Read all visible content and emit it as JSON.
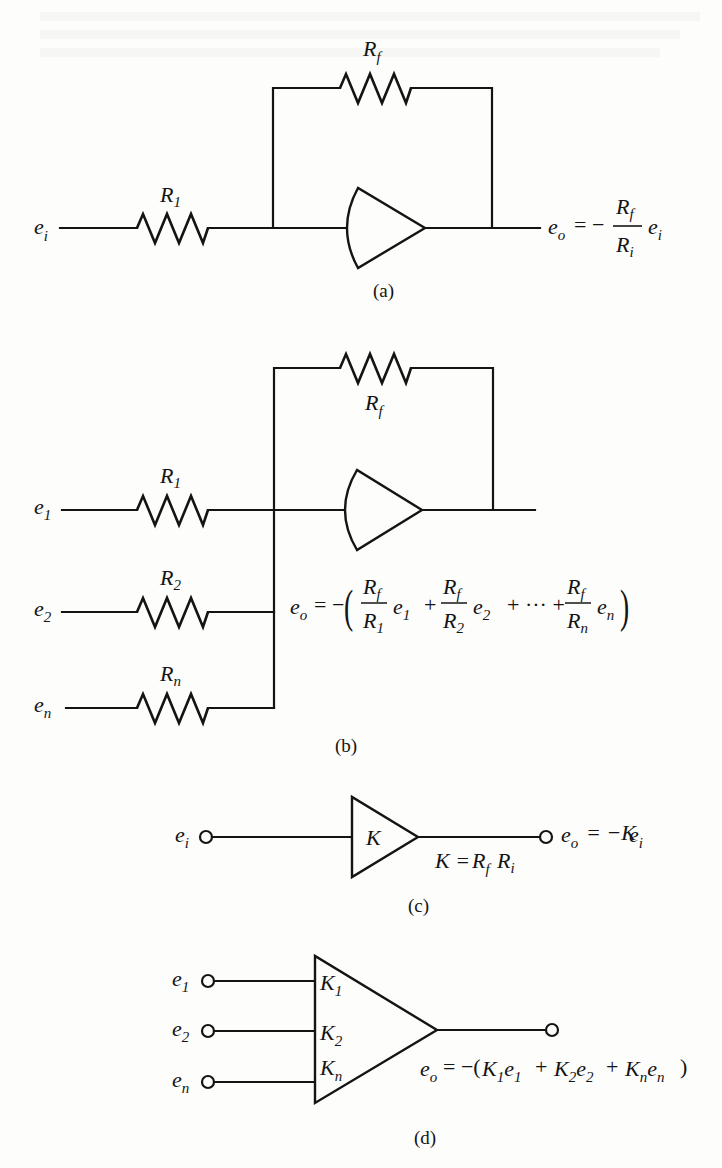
{
  "figure": {
    "panels": [
      {
        "id": "a",
        "caption": "(a)",
        "title": "Inverting amplifier",
        "input_label": {
          "base": "e",
          "sub": "i"
        },
        "input_resistor": {
          "base": "R",
          "sub": "1"
        },
        "feedback_resistor": {
          "base": "R",
          "sub": "f"
        },
        "output_equation": {
          "lhs_base": "e",
          "lhs_sub": "o",
          "eq": "= −",
          "num_base": "R",
          "num_sub": "f",
          "den_base": "R",
          "den_sub": "i",
          "factor_base": "e",
          "factor_sub": "i",
          "text": "e_o = − (R_f / R_i) e_i"
        }
      },
      {
        "id": "b",
        "caption": "(b)",
        "title": "Summing amplifier",
        "inputs": [
          {
            "label_base": "e",
            "label_sub": "1",
            "resistor_base": "R",
            "resistor_sub": "1"
          },
          {
            "label_base": "e",
            "label_sub": "2",
            "resistor_base": "R",
            "resistor_sub": "2"
          },
          {
            "label_base": "e",
            "label_sub": "n",
            "resistor_base": "R",
            "resistor_sub": "n"
          }
        ],
        "feedback_resistor": {
          "base": "R",
          "sub": "f"
        },
        "output_equation": {
          "lhs_base": "e",
          "lhs_sub": "o",
          "eq": "= −",
          "open_paren": "(",
          "close_paren": ")",
          "plus": "+",
          "ellipsis": "+ ··· +",
          "terms": [
            {
              "num_base": "R",
              "num_sub": "f",
              "den_base": "R",
              "den_sub": "1",
              "e_base": "e",
              "e_sub": "1"
            },
            {
              "num_base": "R",
              "num_sub": "f",
              "den_base": "R",
              "den_sub": "2",
              "e_base": "e",
              "e_sub": "2"
            },
            {
              "num_base": "R",
              "num_sub": "f",
              "den_base": "R",
              "den_sub": "n",
              "e_base": "e",
              "e_sub": "n"
            }
          ],
          "text": "e_o = −(R_f/R_1 e_1 + R_f/R_2 e_2 + ··· + R_f/R_n e_n)"
        }
      },
      {
        "id": "c",
        "caption": "(c)",
        "title": "Block symbol of inverting amplifier",
        "input_label": {
          "base": "e",
          "sub": "i"
        },
        "gain_label": "K",
        "gain_definition": {
          "lhs": "K =",
          "r1_base": "R",
          "r1_sub": "f",
          "r2_base": "R",
          "r2_sub": "i",
          "text": "K = R_f R_i"
        },
        "output_equation": {
          "lhs_base": "e",
          "lhs_sub": "o",
          "rhs": "= −K",
          "e_base": "e",
          "e_sub": "i",
          "text": "e_o = −Ke_i"
        }
      },
      {
        "id": "d",
        "caption": "(d)",
        "title": "Block symbol of summing amplifier",
        "inputs": [
          {
            "label_base": "e",
            "label_sub": "1",
            "gain_base": "K",
            "gain_sub": "1"
          },
          {
            "label_base": "e",
            "label_sub": "2",
            "gain_base": "K",
            "gain_sub": "2"
          },
          {
            "label_base": "e",
            "label_sub": "n",
            "gain_base": "K",
            "gain_sub": "n"
          }
        ],
        "output_equation": {
          "lhs_base": "e",
          "lhs_sub": "o",
          "open": "= −(",
          "close": ")",
          "plus": "+",
          "terms": [
            {
              "k_base": "K",
              "k_sub": "1",
              "e_base": "e",
              "e_sub": "1"
            },
            {
              "k_base": "K",
              "k_sub": "2",
              "e_base": "e",
              "e_sub": "2"
            },
            {
              "k_base": "K",
              "k_sub": "n",
              "e_base": "e",
              "e_sub": "n"
            }
          ],
          "text": "e_o = −(K_1e_1 + K_2e_2 + K_ne_n)"
        }
      }
    ],
    "colors": {
      "ink": "#141414",
      "paper": "#fdfdfc"
    }
  }
}
